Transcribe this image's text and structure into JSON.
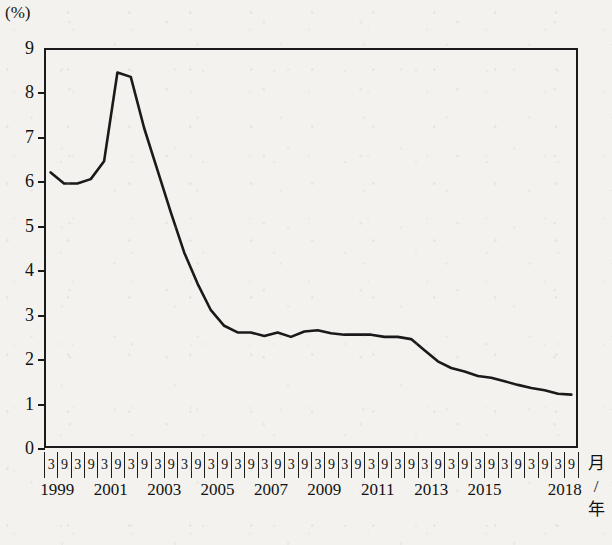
{
  "chart_data": {
    "type": "line",
    "title": "",
    "xlabel": "月 / 年",
    "ylabel": "(%)",
    "ylim": [
      0,
      9
    ],
    "ytick_labels": [
      "9",
      "8",
      "7",
      "6",
      "5",
      "4",
      "3",
      "2",
      "1",
      "0"
    ],
    "ytick_values": [
      9,
      8,
      7,
      6,
      5,
      4,
      3,
      2,
      1,
      0
    ],
    "grid": false,
    "legend": "none",
    "x_month_ticks": [
      "3",
      "9",
      "3",
      "9",
      "3",
      "9",
      "3",
      "9",
      "3",
      "9",
      "3",
      "9",
      "3",
      "9",
      "3",
      "9",
      "3",
      "9",
      "3",
      "9",
      "3",
      "9",
      "3",
      "9",
      "3",
      "9",
      "3",
      "9",
      "3",
      "9",
      "3",
      "9",
      "3",
      "9",
      "3",
      "9",
      "3",
      "9",
      "3",
      "9"
    ],
    "x_year_labels": [
      "1999",
      "2001",
      "2003",
      "2005",
      "2007",
      "2009",
      "2011",
      "2013",
      "2015",
      "2018"
    ],
    "x_year_label_index": [
      0,
      4,
      8,
      12,
      16,
      20,
      24,
      28,
      32,
      38
    ],
    "x": [
      "1999/3",
      "1999/9",
      "2000/3",
      "2000/9",
      "2001/3",
      "2001/9",
      "2002/3",
      "2002/9",
      "2003/3",
      "2003/9",
      "2004/3",
      "2004/9",
      "2005/3",
      "2005/9",
      "2006/3",
      "2006/9",
      "2007/3",
      "2007/9",
      "2008/3",
      "2008/9",
      "2009/3",
      "2009/9",
      "2010/3",
      "2010/9",
      "2011/3",
      "2011/9",
      "2012/3",
      "2012/9",
      "2013/3",
      "2013/9",
      "2014/3",
      "2014/9",
      "2015/3",
      "2015/9",
      "2016/3",
      "2016/9",
      "2017/3",
      "2017/9",
      "2018/3",
      "2018/9"
    ],
    "values": [
      6.2,
      5.95,
      5.95,
      6.05,
      6.45,
      8.45,
      8.35,
      7.2,
      6.25,
      5.3,
      4.4,
      3.7,
      3.1,
      2.75,
      2.6,
      2.6,
      2.52,
      2.6,
      2.5,
      2.62,
      2.65,
      2.58,
      2.55,
      2.55,
      2.55,
      2.5,
      2.5,
      2.45,
      2.2,
      1.95,
      1.8,
      1.72,
      1.62,
      1.58,
      1.5,
      1.42,
      1.35,
      1.3,
      1.22,
      1.2
    ],
    "line_color": "#1a1a1a",
    "line_width": 2.6
  },
  "axis": {
    "y_unit": "(%)",
    "x_unit_line1": "月",
    "x_unit_line2": "/",
    "x_unit_line3": "年"
  }
}
